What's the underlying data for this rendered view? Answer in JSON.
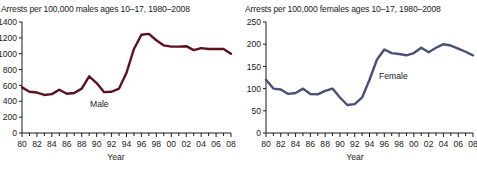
{
  "figure": {
    "background_color": "#ffffff",
    "axis_color": "#1a1a1a",
    "text_color": "#1a1a1a"
  },
  "panels": {
    "male": {
      "title": "Arrests per 100,000 males ages 10–17, 1980–2008",
      "series_label": "Male",
      "line_color": "#5c1020",
      "xlabel": "Year"
    },
    "female": {
      "title": "Arrests per 100,000 females ages 10–17, 1980–2008",
      "series_label": "Female",
      "line_color": "#4a4f7a",
      "xlabel": "Year"
    }
  },
  "chart_data": [
    {
      "type": "line",
      "title": "Arrests per 100,000 males ages 10–17, 1980–2008",
      "xlabel": "Year",
      "ylabel": "",
      "legend": [
        "Male"
      ],
      "legend_position": "inline-annotation",
      "grid": false,
      "line_color": "#5c1020",
      "xlim": [
        1980,
        2008
      ],
      "ylim": [
        0,
        1400
      ],
      "yticks": [
        0,
        200,
        400,
        600,
        800,
        1000,
        1200,
        1400
      ],
      "ytick_labels": [
        "0",
        "200",
        "400",
        "600",
        "800",
        "1000",
        "1200",
        "1400"
      ],
      "xticks": [
        1980,
        1982,
        1984,
        1986,
        1988,
        1990,
        1992,
        1994,
        1996,
        1998,
        2000,
        2002,
        2004,
        2006,
        2008
      ],
      "xtick_labels": [
        "80",
        "82",
        "84",
        "86",
        "88",
        "90",
        "92",
        "94",
        "96",
        "98",
        "00",
        "02",
        "04",
        "06",
        "08"
      ],
      "x": [
        1980,
        1981,
        1982,
        1983,
        1984,
        1985,
        1986,
        1987,
        1988,
        1989,
        1990,
        1991,
        1992,
        1993,
        1994,
        1995,
        1996,
        1997,
        1998,
        1999,
        2000,
        2001,
        2002,
        2003,
        2004,
        2005,
        2006,
        2007,
        2008
      ],
      "values": [
        575,
        520,
        510,
        480,
        490,
        545,
        495,
        505,
        560,
        715,
        630,
        515,
        520,
        560,
        760,
        1060,
        1240,
        1250,
        1170,
        1105,
        1090,
        1090,
        1095,
        1045,
        1070,
        1060,
        1060,
        1060,
        1000
      ]
    },
    {
      "type": "line",
      "title": "Arrests per 100,000 females ages 10–17, 1980–2008",
      "xlabel": "Year",
      "ylabel": "",
      "legend": [
        "Female"
      ],
      "legend_position": "inline-annotation",
      "grid": false,
      "line_color": "#4a4f7a",
      "xlim": [
        1980,
        2008
      ],
      "ylim": [
        0,
        250
      ],
      "yticks": [
        0,
        50,
        100,
        150,
        200,
        250
      ],
      "ytick_labels": [
        "0",
        "50",
        "100",
        "150",
        "200",
        "250"
      ],
      "xticks": [
        1980,
        1982,
        1984,
        1986,
        1988,
        1990,
        1992,
        1994,
        1996,
        1998,
        2000,
        2002,
        2004,
        2006,
        2008
      ],
      "xtick_labels": [
        "80",
        "82",
        "84",
        "86",
        "88",
        "90",
        "92",
        "94",
        "96",
        "98",
        "00",
        "02",
        "04",
        "06",
        "08"
      ],
      "x": [
        1980,
        1981,
        1982,
        1983,
        1984,
        1985,
        1986,
        1987,
        1988,
        1989,
        1990,
        1991,
        1992,
        1993,
        1994,
        1995,
        1996,
        1997,
        1998,
        1999,
        2000,
        2001,
        2002,
        2003,
        2004,
        2005,
        2006,
        2007,
        2008
      ],
      "values": [
        120,
        100,
        98,
        88,
        90,
        100,
        88,
        87,
        95,
        100,
        80,
        63,
        65,
        80,
        120,
        165,
        188,
        180,
        178,
        175,
        180,
        192,
        182,
        192,
        200,
        197,
        190,
        183,
        175
      ]
    }
  ]
}
